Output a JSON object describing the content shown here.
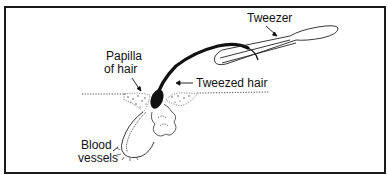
{
  "figure": {
    "type": "diagram",
    "colors": {
      "ink": "#111111",
      "border": "#1a1a1a",
      "background": "#ffffff"
    }
  },
  "labels": {
    "tweezer": "Tweezer",
    "papilla_line1": "Papilla",
    "papilla_line2": "of hair",
    "tweezed_hair": "Tweezed hair",
    "blood_line1": "Blood",
    "blood_line2": "vessels"
  }
}
